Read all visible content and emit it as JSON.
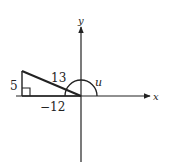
{
  "diagram": {
    "type": "trig-reference-triangle",
    "axes": {
      "x_label": "x",
      "y_label": "y"
    },
    "triangle": {
      "opposite_label": "5",
      "hypotenuse_label": "13",
      "adjacent_label": "−12"
    },
    "angle_label": "u",
    "colors": {
      "stroke": "#222222",
      "background": "#ffffff"
    }
  }
}
